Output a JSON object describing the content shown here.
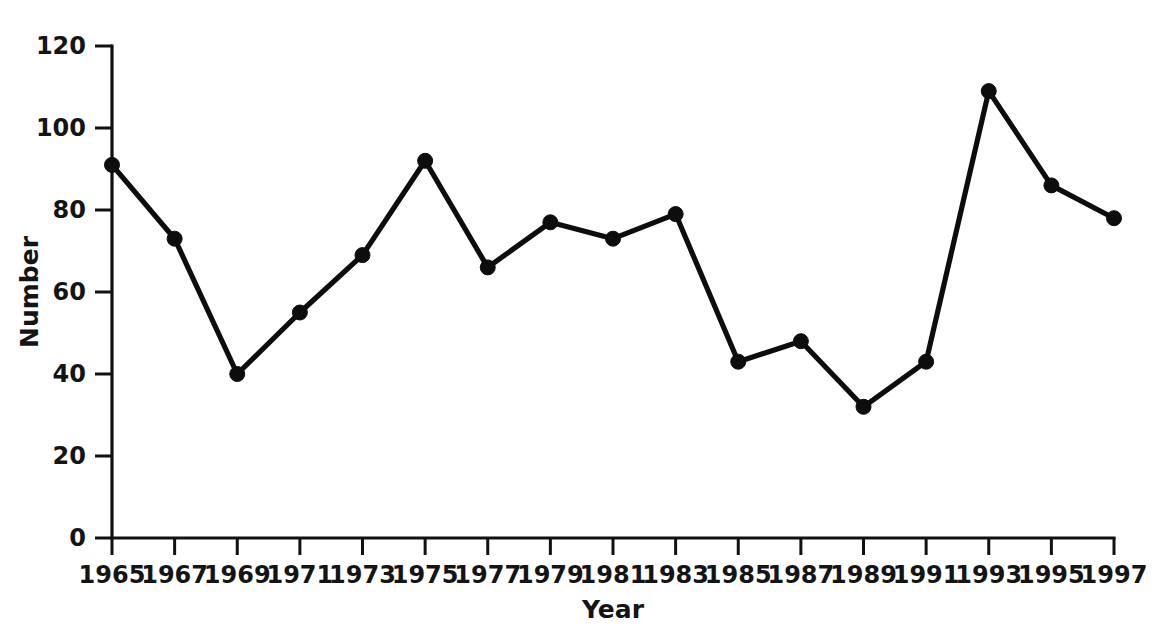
{
  "chart_data": {
    "type": "line",
    "title": "",
    "xlabel": "Year",
    "ylabel": "Number",
    "categories": [
      1965,
      1967,
      1969,
      1971,
      1973,
      1975,
      1977,
      1979,
      1981,
      1983,
      1985,
      1987,
      1989,
      1991,
      1993,
      1995,
      1997
    ],
    "values": [
      91,
      73,
      40,
      55,
      69,
      92,
      66,
      77,
      73,
      79,
      43,
      48,
      32,
      43,
      109,
      86,
      78
    ],
    "series": [
      {
        "name": "Number",
        "values": [
          91,
          73,
          40,
          55,
          69,
          92,
          66,
          77,
          73,
          79,
          43,
          48,
          32,
          43,
          109,
          86,
          78
        ]
      }
    ],
    "x_tick_labels": [
      "1965",
      "1967",
      "1969",
      "1971",
      "1973",
      "1975",
      "1977",
      "1979",
      "1981",
      "1983",
      "1985",
      "1987",
      "1989",
      "1991",
      "1993",
      "1995",
      "1997"
    ],
    "y_tick_labels": [
      "0",
      "20",
      "40",
      "60",
      "80",
      "100",
      "120"
    ],
    "y_ticks": [
      0,
      20,
      40,
      60,
      80,
      100,
      120
    ],
    "ylim": [
      0,
      120
    ],
    "xlim": [
      1965,
      1997
    ],
    "grid": false,
    "legend": false,
    "legend_position": "none",
    "marker": "circle",
    "line_color": "#0d0d0d",
    "marker_color": "#0d0d0d",
    "background_color": "#ffffff",
    "spines": [
      "left",
      "bottom"
    ]
  }
}
